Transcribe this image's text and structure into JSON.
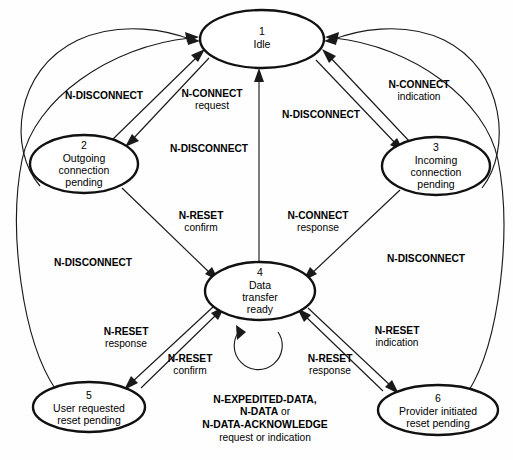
{
  "diagram": {
    "background_color": "#fefefe",
    "stroke_color": "#1a1a1a",
    "node_stroke_color": "#111111",
    "node_fill_color": "#ffffff"
  },
  "states": [
    {
      "id": "1",
      "number": "1",
      "name": "Idle",
      "lines": [
        "Idle"
      ],
      "cx": 262,
      "cy": 39,
      "rx": 62,
      "ry": 29
    },
    {
      "id": "2",
      "number": "2",
      "name": "Outgoing connection pending",
      "lines": [
        "Outgoing",
        "connection",
        "pending"
      ],
      "cx": 84,
      "cy": 164,
      "rx": 54,
      "ry": 29
    },
    {
      "id": "3",
      "number": "3",
      "name": "Incoming connection pending",
      "lines": [
        "Incoming",
        "connection",
        "pending"
      ],
      "cx": 436,
      "cy": 166,
      "rx": 54,
      "ry": 29
    },
    {
      "id": "4",
      "number": "4",
      "name": "Data transfer ready",
      "lines": [
        "Data",
        "transfer",
        "ready"
      ],
      "cx": 260,
      "cy": 291,
      "rx": 55,
      "ry": 29
    },
    {
      "id": "5",
      "number": "5",
      "name": "User requested reset pending",
      "lines": [
        "User requested",
        "reset pending"
      ],
      "cx": 89,
      "cy": 407,
      "rx": 56,
      "ry": 25
    },
    {
      "id": "6",
      "number": "6",
      "name": "Provider initiated reset pending",
      "lines": [
        "Provider initiated",
        "reset pending"
      ],
      "cx": 438,
      "cy": 410,
      "rx": 60,
      "ry": 25
    }
  ],
  "transitions": [
    {
      "id": "t1",
      "from": "2",
      "to": "1",
      "label_bold": "N-DISCONNECT",
      "label_plain": "",
      "label_x": 104,
      "label_y": 99
    },
    {
      "id": "t2",
      "from": "1",
      "to": "2",
      "label_bold": "N-CONNECT",
      "label_plain": "request",
      "label_x": 212,
      "label_y": 97
    },
    {
      "id": "t3",
      "from": "3",
      "to": "1",
      "label_bold": "N-CONNECT",
      "label_plain": "indication",
      "label_x": 419,
      "label_y": 88
    },
    {
      "id": "t4",
      "from": "4",
      "to": "1",
      "label_bold": "N-DISCONNECT",
      "label_plain": "",
      "label_x": 319,
      "label_y": 118
    },
    {
      "id": "t5",
      "from": "2",
      "to": "4",
      "label_bold": "N-DISCONNECT",
      "label_plain": "",
      "label_x": 215,
      "label_y": 152
    },
    {
      "id": "t6",
      "from": "2",
      "to": "4",
      "label_bold": "N-RESET",
      "label_plain": "confirm",
      "label_x": 201,
      "label_y": 219
    },
    {
      "id": "t7",
      "from": "3",
      "to": "4",
      "label_bold": "N-CONNECT",
      "label_plain": "response",
      "label_x": 318,
      "label_y": 219
    },
    {
      "id": "t8",
      "from": "5",
      "to": "1",
      "label_bold": "N-DISCONNECT",
      "label_plain": "",
      "label_x": 93,
      "label_y": 266
    },
    {
      "id": "t9",
      "from": "6",
      "to": "1",
      "label_bold": "N-DISCONNECT",
      "label_plain": "",
      "label_x": 426,
      "label_y": 262
    },
    {
      "id": "t10",
      "from": "4",
      "to": "5",
      "label_bold": "N-RESET",
      "label_plain": "response",
      "label_x": 126,
      "label_y": 335
    },
    {
      "id": "t11",
      "from": "5",
      "to": "4",
      "label_bold": "N-RESET",
      "label_plain": "confirm",
      "label_x": 190,
      "label_y": 362
    },
    {
      "id": "t12",
      "from": "4",
      "to": "6",
      "label_bold": "N-RESET",
      "label_plain": "indication",
      "label_x": 397,
      "label_y": 334
    },
    {
      "id": "t13",
      "from": "6",
      "to": "4",
      "label_bold": "N-RESET",
      "label_plain": "response",
      "label_x": 330,
      "label_y": 362
    }
  ],
  "self_loop": {
    "on_state": "4",
    "label_line1_bold": "N-EXPEDITED-DATA,",
    "label_line2_bold": "N-DATA",
    "label_line2_plain": " or",
    "label_line3_bold": "N-DATA-ACKNOWLEDGE",
    "label_line4_plain": "request or indication",
    "label_x": 265,
    "label_y": 400
  }
}
